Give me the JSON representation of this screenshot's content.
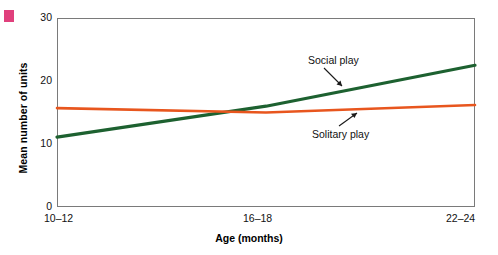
{
  "figure": {
    "corner_marker_color": "#e0407c",
    "background_color": "#ffffff",
    "frame_color": "#7a7a7a"
  },
  "chart_data": {
    "type": "line",
    "title": "",
    "subtitle": "",
    "xlabel": "Age (months)",
    "ylabel": "Mean number of units",
    "categories": [
      "10–12",
      "16–18",
      "22–24"
    ],
    "x": [
      0,
      1,
      2
    ],
    "xlim": [
      0,
      2
    ],
    "ylim": [
      0,
      30
    ],
    "yticks": [
      0,
      10,
      20,
      30
    ],
    "ytick_labels": [
      "0",
      "10",
      "20",
      "30"
    ],
    "xtick_labels": [
      "10–12",
      "16–18",
      "22–24"
    ],
    "grid": false,
    "legend_position": "inline-annotations",
    "series": [
      {
        "name": "Social play",
        "color": "#1d6130",
        "values": [
          11.1,
          16.0,
          22.5
        ],
        "annotation": "Social play"
      },
      {
        "name": "Solitary play",
        "color": "#e8561e",
        "values": [
          15.7,
          15.0,
          16.2
        ],
        "annotation": "Solitary play"
      }
    ],
    "annotations": [
      {
        "text": "Social play",
        "points_to": "Social play line"
      },
      {
        "text": "Solitary play",
        "points_to": "Solitary play line"
      }
    ]
  },
  "axes": {
    "y_title": "Mean number of units",
    "x_title": "Age (months)",
    "y_labels": [
      "30",
      "20",
      "10",
      "0"
    ],
    "x_labels": [
      "10–12",
      "16–18",
      "22–24"
    ]
  },
  "labels": {
    "social_play": "Social play",
    "solitary_play": "Solitary play"
  }
}
